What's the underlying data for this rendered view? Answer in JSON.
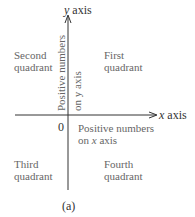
{
  "diagram": {
    "axes": {
      "y_axis_label_var": "y",
      "y_axis_label_word": " axis",
      "x_axis_label_var": "x",
      "x_axis_label_word": " axis",
      "origin_label": "0",
      "line_color": "#333333"
    },
    "quadrants": {
      "first": {
        "line1": "First",
        "line2": "quadrant"
      },
      "second": {
        "line1": "Second",
        "line2": "quadrant"
      },
      "third": {
        "line1": "Third",
        "line2": "quadrant"
      },
      "fourth": {
        "line1": "Fourth",
        "line2": "quadrant"
      }
    },
    "annotations": {
      "y_positive_line1": "Positive numbers",
      "y_positive_line2": "on y axis",
      "x_positive_line1": "Positive numbers",
      "x_positive_line2_prefix": "on ",
      "x_positive_line2_var": "x",
      "x_positive_line2_suffix": " axis"
    },
    "caption": "(a)"
  }
}
